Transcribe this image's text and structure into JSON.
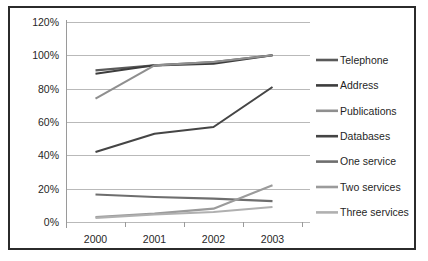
{
  "chart_data": {
    "type": "line",
    "title": "",
    "subtitle": "",
    "xlabel": "",
    "ylabel": "",
    "x": [
      "2000",
      "2001",
      "2002",
      "2003"
    ],
    "categories": [
      "2000",
      "2001",
      "2002",
      "2003"
    ],
    "ylim": [
      0,
      120
    ],
    "ytick_labels": [
      "0%",
      "20%",
      "40%",
      "60%",
      "80%",
      "100%",
      "120%"
    ],
    "ytick_values": [
      0,
      20,
      40,
      60,
      80,
      100,
      120
    ],
    "grid": true,
    "legend_position": "right",
    "series": [
      {
        "name": "Telephone",
        "values": [
          91,
          94,
          96,
          100
        ],
        "color": "#5a5a5a"
      },
      {
        "name": "Address",
        "values": [
          89,
          94,
          95,
          100
        ],
        "color": "#3d3d3d"
      },
      {
        "name": "Publications",
        "values": [
          74,
          94,
          96,
          100
        ],
        "color": "#8f8f8f"
      },
      {
        "name": "Databases",
        "values": [
          42,
          53,
          57,
          81
        ],
        "color": "#454545"
      },
      {
        "name": "One service",
        "values": [
          16.5,
          15,
          14,
          12.5
        ],
        "color": "#6e6e6e"
      },
      {
        "name": "Two services",
        "values": [
          3,
          5,
          8,
          22
        ],
        "color": "#9b9b9b"
      },
      {
        "name": "Three services",
        "values": [
          2.5,
          4.5,
          6,
          9
        ],
        "color": "#b0b0b0"
      }
    ]
  },
  "legend": {
    "items": [
      {
        "label": "Telephone"
      },
      {
        "label": "Address"
      },
      {
        "label": "Publications"
      },
      {
        "label": "Databases"
      },
      {
        "label": "One service"
      },
      {
        "label": "Two services"
      },
      {
        "label": "Three services"
      }
    ]
  },
  "colors": {
    "frame": "#2b2b2b",
    "grid": "#b9b9b9",
    "background": "#ffffff",
    "text": "#1f1f1f"
  }
}
